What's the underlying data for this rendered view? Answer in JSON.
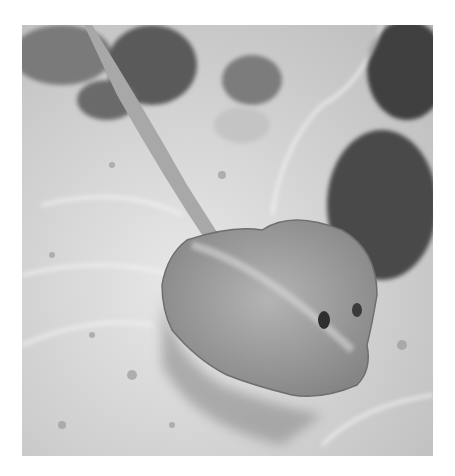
{
  "image": {
    "description": "Grayscale underwater photograph of a stingray on a sandy seabed with rocks and caustic light patterns",
    "subject": "stingray",
    "colors": {
      "background": "#ffffff",
      "sand": "#cfcfcf",
      "sand_light": "#e6e6e6",
      "rock_dark": "#4a4a4a",
      "ray_body": "#9a9a9a",
      "shadow": "#7a7a7a"
    }
  }
}
